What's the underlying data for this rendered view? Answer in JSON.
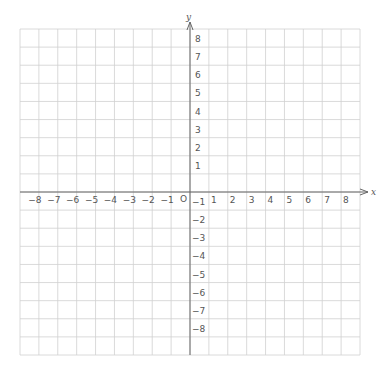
{
  "diagram": {
    "type": "coordinate-plane",
    "x_axis": {
      "name": "x",
      "min": -9,
      "max": 9,
      "labels": [
        "-8",
        "-7",
        "-6",
        "-5",
        "-4",
        "-3",
        "-2",
        "-1",
        "1",
        "2",
        "3",
        "4",
        "5",
        "6",
        "7",
        "8"
      ],
      "label_values": [
        -8,
        -7,
        -6,
        -5,
        -4,
        -3,
        -2,
        -1,
        1,
        2,
        3,
        4,
        5,
        6,
        7,
        8
      ]
    },
    "y_axis": {
      "name": "y",
      "min": -9,
      "max": 9,
      "labels": [
        "8",
        "7",
        "6",
        "5",
        "4",
        "3",
        "2",
        "1",
        "-1",
        "-2",
        "-3",
        "-4",
        "-5",
        "-6",
        "-7",
        "-8"
      ],
      "label_values": [
        8,
        7,
        6,
        5,
        4,
        3,
        2,
        1,
        -1,
        -2,
        -3,
        -4,
        -5,
        -6,
        -7,
        -8
      ]
    },
    "origin_label": "O",
    "grid": {
      "on": true,
      "step": 1,
      "color": "#d0d0d0"
    },
    "axis_color": "#666666",
    "label_color": "#555555"
  }
}
